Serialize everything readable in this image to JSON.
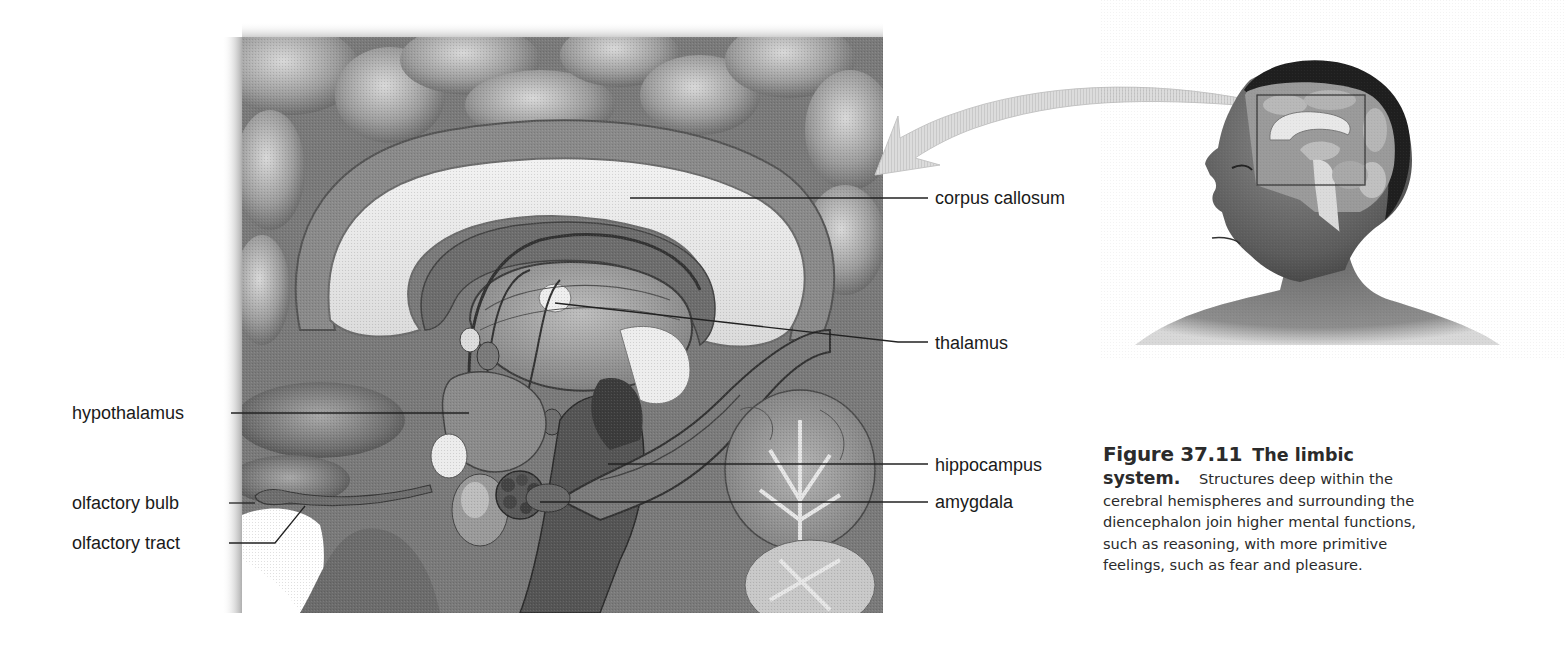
{
  "figure": {
    "number": "Figure 37.11",
    "title": "The limbic",
    "title_cont": "system.",
    "caption_lines": [
      "Structures deep within the",
      "cerebral hemispheres and surrounding the",
      "diencephalon join higher mental functions,",
      "such as reasoning, with more primitive",
      "feelings, such as fear and pleasure."
    ]
  },
  "labels": {
    "corpus_callosum": "corpus callosum",
    "thalamus": "thalamus",
    "hypothalamus": "hypothalamus",
    "hippocampus": "hippocampus",
    "amygdala": "amygdala",
    "olfactory_bulb": "olfactory bulb",
    "olfactory_tract": "olfactory tract"
  },
  "illustrations": {
    "main": "brain-sagittal-section-limbic-system",
    "inset": "head-profile-with-brain-cutaway",
    "arrow": "zoom-callout-arrow"
  },
  "colors": {
    "label_text": "#1a1a1a",
    "caption_text": "#2b2b2b",
    "leader_line": "#222222",
    "background": "#ffffff"
  }
}
